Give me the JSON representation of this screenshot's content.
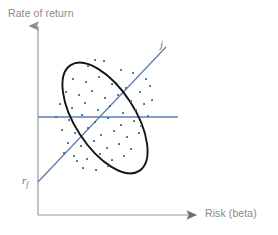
{
  "figure": {
    "title": "",
    "background_color": "#ffffff",
    "width": 278,
    "height": 235
  },
  "axes": {
    "y_label": "Rate of return",
    "x_label": "Risk (beta)",
    "axis_color": "#9a9a9a",
    "y_axis": {
      "x": 38,
      "y_top": 22,
      "y_bottom": 215,
      "arrow": "up-arrow-icon"
    },
    "x_axis": {
      "y": 215,
      "x_left": 38,
      "x_right": 200,
      "arrow": "right-arrow-icon"
    }
  },
  "annotations": {
    "security_line_label": "j",
    "risk_free_label": "r",
    "risk_free_sub": "f"
  },
  "colors": {
    "accent_blue": "#5b7fb4",
    "ellipse_black": "#151515",
    "point_blue": "#4a6a96",
    "axis_gray": "#9a9a9a",
    "text_gray": "#8a8a8a"
  },
  "chart_data": {
    "type": "scatter",
    "title": "",
    "xlabel": "Risk (beta)",
    "ylabel": "Rate of return",
    "xlim": [
      0,
      10
    ],
    "ylim": [
      0,
      10
    ],
    "grid": false,
    "legend": null,
    "series": [
      {
        "name": "securities",
        "type": "scatter",
        "marker": "small-square",
        "color": "#4a6a96",
        "points": [
          [
            88,
            66
          ],
          [
            104,
            61
          ],
          [
            121,
            70
          ],
          [
            133,
            73
          ],
          [
            146,
            79
          ],
          [
            73,
            79
          ],
          [
            86,
            82
          ],
          [
            99,
            77
          ],
          [
            112,
            84
          ],
          [
            126,
            88
          ],
          [
            140,
            92
          ],
          [
            150,
            86
          ],
          [
            66,
            92
          ],
          [
            79,
            95
          ],
          [
            92,
            91
          ],
          [
            105,
            98
          ],
          [
            118,
            95
          ],
          [
            131,
            101
          ],
          [
            144,
            104
          ],
          [
            60,
            104
          ],
          [
            72,
            108
          ],
          [
            85,
            103
          ],
          [
            98,
            110
          ],
          [
            110,
            106
          ],
          [
            123,
            113
          ],
          [
            136,
            110
          ],
          [
            148,
            116
          ],
          [
            56,
            117
          ],
          [
            69,
            120
          ],
          [
            82,
            115
          ],
          [
            95,
            122
          ],
          [
            108,
            118
          ],
          [
            121,
            125
          ],
          [
            134,
            121
          ],
          [
            62,
            130
          ],
          [
            75,
            133
          ],
          [
            88,
            128
          ],
          [
            101,
            135
          ],
          [
            114,
            131
          ],
          [
            127,
            137
          ],
          [
            139,
            133
          ],
          [
            68,
            143
          ],
          [
            81,
            146
          ],
          [
            94,
            141
          ],
          [
            107,
            148
          ],
          [
            119,
            144
          ],
          [
            131,
            149
          ],
          [
            74,
            156
          ],
          [
            87,
            159
          ],
          [
            100,
            154
          ],
          [
            112,
            160
          ],
          [
            124,
            156
          ],
          [
            83,
            168
          ],
          [
            96,
            170
          ],
          [
            108,
            166
          ],
          [
            64,
            153
          ],
          [
            141,
            126
          ],
          [
            152,
            100
          ],
          [
            95,
            60
          ],
          [
            77,
            161
          ]
        ]
      }
    ],
    "lines": [
      {
        "name": "security-market-line",
        "label": "j",
        "color": "#5b7fb4",
        "x1": 38,
        "y1": 182,
        "x2": 166,
        "y2": 47,
        "intercept_label": "r_f",
        "description": "Upward sloping security market line originating at the risk-free rate"
      },
      {
        "name": "market-average-line",
        "label": "",
        "color": "#5b7fb4",
        "x1": 38,
        "y1": 117,
        "x2": 178,
        "y2": 117,
        "description": "Horizontal line representing average market return"
      }
    ],
    "shapes": [
      {
        "name": "confidence-ellipse",
        "type": "ellipse",
        "color": "#151515",
        "cx": 105,
        "cy": 118,
        "rx": 30,
        "ry": 63,
        "rotation_deg": -33,
        "filled": false
      }
    ]
  }
}
